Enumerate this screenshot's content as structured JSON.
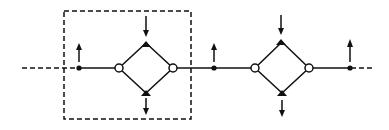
{
  "diagram": {
    "type": "schematic-chain",
    "stroke_color": "#111111",
    "background": "#ffffff",
    "main_line_y": 68,
    "dashed_box": {
      "x": 64,
      "y": 11,
      "width": 127,
      "height": 108
    },
    "input_dashed_segment": {
      "x1": 22,
      "x2": 79
    },
    "output_dashed_segment": {
      "x1": 350,
      "x2": 373
    },
    "junction_dots": [
      {
        "x": 79,
        "arrow": "up"
      },
      {
        "x": 214,
        "arrow": "up"
      },
      {
        "x": 350,
        "arrow": "up"
      }
    ],
    "diamonds": [
      {
        "cx": 146,
        "left_x": 119,
        "right_x": 173,
        "top_y": 43,
        "bottom_y": 93,
        "in_arrow": "down-into-top",
        "out_arrow": "down-from-bottom"
      },
      {
        "cx": 282,
        "left_x": 255,
        "right_x": 309,
        "top_y": 41,
        "bottom_y": 93,
        "in_arrow": "down-into-top",
        "out_arrow": "down-from-bottom"
      }
    ]
  }
}
